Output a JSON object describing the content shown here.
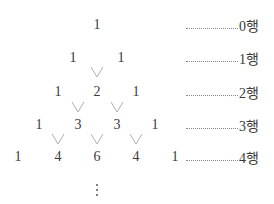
{
  "diagram": {
    "title": "",
    "rows": [
      {
        "index": 0,
        "values": [
          "1"
        ],
        "label": "0행"
      },
      {
        "index": 1,
        "values": [
          "1",
          "1"
        ],
        "label": "1행"
      },
      {
        "index": 2,
        "values": [
          "1",
          "2",
          "1"
        ],
        "label": "2행"
      },
      {
        "index": 3,
        "values": [
          "1",
          "3",
          "3",
          "1"
        ],
        "label": "3행"
      },
      {
        "index": 4,
        "values": [
          "1",
          "4",
          "6",
          "4",
          "1"
        ],
        "label": "4행"
      }
    ],
    "continuation": "⋮",
    "connector_color": "#b0b0b0",
    "text_color": "#3a3a3a"
  }
}
